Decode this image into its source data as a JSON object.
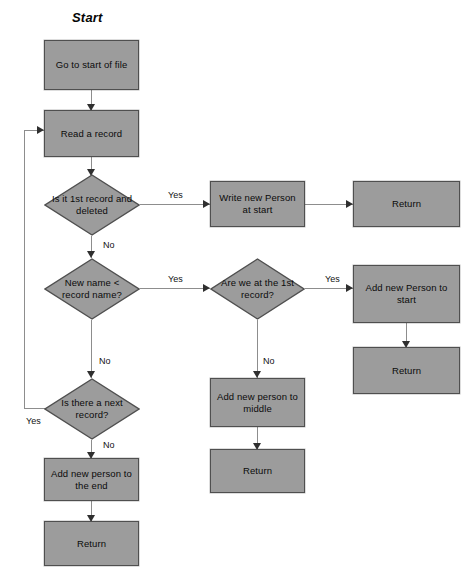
{
  "diagram": {
    "title": "Start",
    "type": "flowchart",
    "colors": {
      "node_fill": "#9c9c9c",
      "node_border": "#4f4f4f",
      "connector": "#8d8d8d",
      "arrowhead": "#2f2f2f",
      "text": "#0b0b0b",
      "background": "#ffffff"
    },
    "nodes": {
      "go_to_start": "Go to start of file",
      "read_record": "Read a record",
      "is_first_deleted": "Is it 1st record and deleted",
      "write_person_start": "Write new Person at start",
      "return_top_right": "Return",
      "new_name_lt": "New name < record name?",
      "are_we_first": "Are we at the 1st record?",
      "add_person_start": "Add new Person to start",
      "return_right_mid": "Return",
      "add_person_middle": "Add new person to middle",
      "return_middle": "Return",
      "is_next_record": "Is there a next record?",
      "add_person_end": "Add new person to the end",
      "return_bottom_left": "Return"
    },
    "edge_labels": {
      "first_deleted_yes": "Yes",
      "first_deleted_no": "No",
      "new_name_yes": "Yes",
      "new_name_no": "No",
      "are_we_first_yes": "Yes",
      "are_we_first_no": "No",
      "next_record_yes": "Yes",
      "next_record_no": "No"
    }
  }
}
